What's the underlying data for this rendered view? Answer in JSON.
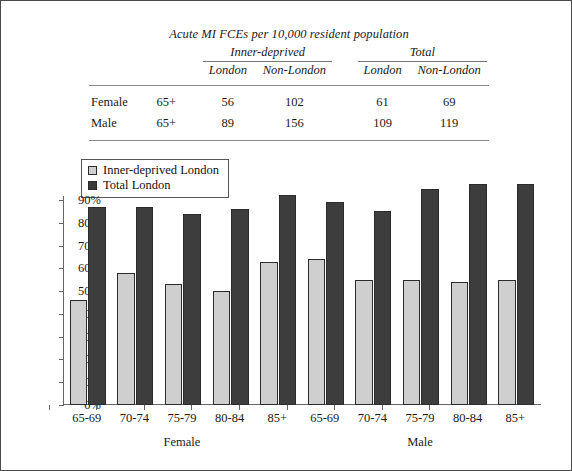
{
  "table": {
    "title": "Acute MI FCEs per 10,000 resident population",
    "group_headers": [
      "Inner-deprived",
      "Total"
    ],
    "column_headers": [
      "London",
      "Non-London",
      "London",
      "Non-London"
    ],
    "rows": [
      {
        "sex": "Female",
        "age": "65+",
        "inner_london": "56",
        "inner_non_london": "102",
        "total_london": "61",
        "total_non_london": "69"
      },
      {
        "sex": "Male",
        "age": "65+",
        "inner_london": "89",
        "inner_non_london": "156",
        "total_london": "109",
        "total_non_london": "119"
      }
    ]
  },
  "legend": {
    "items": [
      {
        "label": "Inner-deprived London",
        "color": "#cfcfcf"
      },
      {
        "label": "Total London",
        "color": "#3d3d3d"
      }
    ]
  },
  "chart_data": {
    "type": "bar",
    "title": "",
    "xlabel": "",
    "ylabel": "",
    "ylim": [
      0,
      90
    ],
    "grid": false,
    "legend_position": "top-left",
    "ytick_labels": [
      "0%",
      "10%",
      "20%",
      "30%",
      "40%",
      "50%",
      "60%",
      "70%",
      "80%",
      "90%"
    ],
    "ytick_values": [
      0,
      10,
      20,
      30,
      40,
      50,
      60,
      70,
      80,
      90
    ],
    "categories": [
      "65-69",
      "70-74",
      "75-79",
      "80-84",
      "85+",
      "65-69",
      "70-74",
      "75-79",
      "80-84",
      "85+"
    ],
    "group_labels": [
      "Female",
      "Male"
    ],
    "group_spans": [
      5,
      5
    ],
    "series": [
      {
        "name": "Inner-deprived London",
        "color": "#cfcfcf",
        "values": [
          46,
          58,
          53,
          50,
          63,
          64,
          55,
          55,
          54,
          55
        ]
      },
      {
        "name": "Total London",
        "color": "#3d3d3d",
        "values": [
          87,
          87,
          84,
          86,
          92,
          89,
          85,
          95,
          97,
          97
        ]
      }
    ]
  }
}
